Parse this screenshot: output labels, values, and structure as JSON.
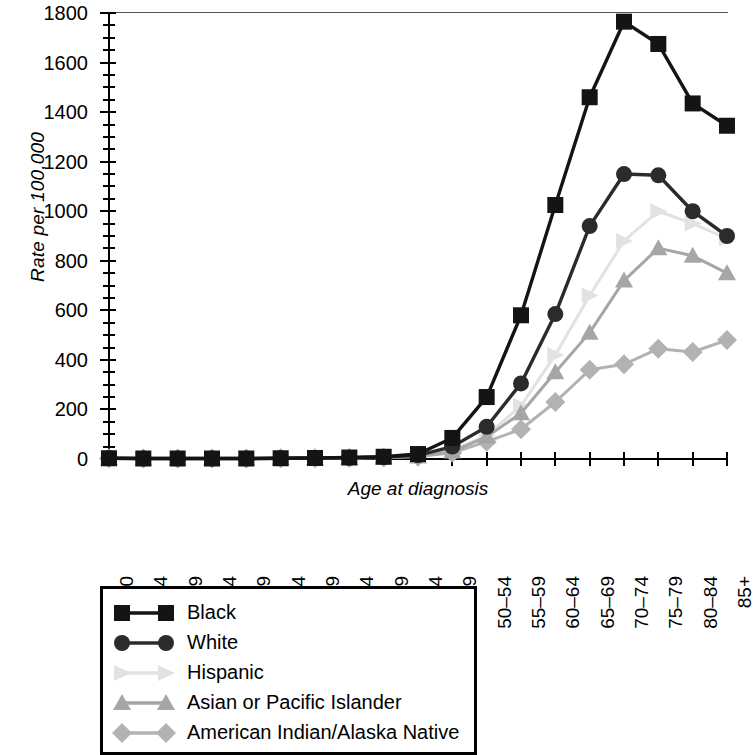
{
  "chart_data": {
    "type": "line",
    "title": "",
    "xlabel": "Age at diagnosis",
    "ylabel": "Rate per 100,000",
    "ylim": [
      0,
      1800
    ],
    "ytick_step": 200,
    "yticks": [
      0,
      200,
      400,
      600,
      800,
      1000,
      1200,
      1400,
      1600,
      1800
    ],
    "grid": false,
    "legend_position": "below-plot",
    "categories": [
      "00",
      "01–04",
      "05–09",
      "10–14",
      "15–19",
      "20–24",
      "25–29",
      "30–34",
      "35–39",
      "40–44",
      "45–49",
      "50–54",
      "55–59",
      "60–64",
      "65–69",
      "70–74",
      "75–79",
      "80–84",
      "85+"
    ],
    "series": [
      {
        "name": "Black",
        "marker": "square",
        "color": "#141414",
        "values": [
          3,
          2,
          2,
          2,
          2,
          3,
          4,
          6,
          9,
          20,
          85,
          250,
          580,
          1025,
          1460,
          1765,
          1675,
          1435,
          1345
        ]
      },
      {
        "name": "White",
        "marker": "circle",
        "color": "#2b2b2b",
        "values": [
          3,
          2,
          2,
          2,
          2,
          3,
          4,
          5,
          8,
          15,
          50,
          130,
          305,
          585,
          940,
          1150,
          1145,
          1000,
          900
        ]
      },
      {
        "name": "Hispanic",
        "marker": "triangle-right",
        "color": "#e2e2e2",
        "values": [
          3,
          2,
          2,
          2,
          2,
          3,
          3,
          5,
          7,
          12,
          35,
          95,
          215,
          420,
          660,
          880,
          1000,
          950,
          890
        ]
      },
      {
        "name": "Asian or Pacific Islander",
        "marker": "triangle",
        "color": "#a6a6a6",
        "values": [
          3,
          2,
          2,
          2,
          2,
          3,
          3,
          4,
          6,
          10,
          30,
          90,
          185,
          350,
          510,
          720,
          851,
          820,
          750
        ]
      },
      {
        "name": "American Indian/Alaska Native",
        "marker": "diamond",
        "color": "#b2b2b2",
        "values": [
          3,
          2,
          2,
          2,
          2,
          3,
          3,
          4,
          6,
          10,
          25,
          70,
          120,
          230,
          360,
          382,
          445,
          432,
          480
        ]
      }
    ]
  },
  "axis": {
    "y_label": "Rate per 100,000",
    "x_label": "Age at diagnosis"
  },
  "legend": {
    "items": [
      {
        "label": "Black"
      },
      {
        "label": "White"
      },
      {
        "label": "Hispanic"
      },
      {
        "label": "Asian or Pacific Islander"
      },
      {
        "label": "American Indian/Alaska Native"
      }
    ]
  }
}
